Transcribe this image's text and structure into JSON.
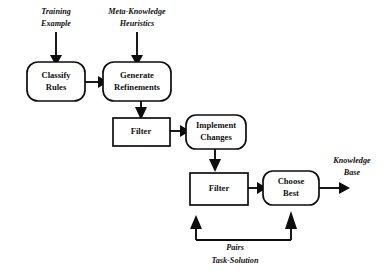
{
  "diagram": {
    "background_color": "#ffffff",
    "line_color": "#0d0d0d",
    "nodes": [
      {
        "id": "classify_rules",
        "label_line1": "Classify",
        "label_line2": "Rules",
        "shape": "rounded-rect",
        "x": 27,
        "y": 62,
        "w": 58,
        "h": 39
      },
      {
        "id": "generate_refinements",
        "label_line1": "Generate",
        "label_line2": "Refinements",
        "shape": "rounded-rect",
        "x": 103,
        "y": 62,
        "w": 68,
        "h": 39
      },
      {
        "id": "filter_1",
        "label_line1": "Filter",
        "label_line2": "",
        "shape": "rect",
        "x": 113,
        "y": 118,
        "w": 57,
        "h": 28
      },
      {
        "id": "implement_changes",
        "label_line1": "Implement",
        "label_line2": "Changes",
        "shape": "rounded-rect",
        "x": 186,
        "y": 115,
        "w": 60,
        "h": 34
      },
      {
        "id": "filter_2",
        "label_line1": "Filter",
        "label_line2": "",
        "shape": "rect",
        "x": 190,
        "y": 173,
        "w": 58,
        "h": 32
      },
      {
        "id": "choose_best",
        "label_line1": "Choose",
        "label_line2": "Best",
        "shape": "rounded-rect",
        "x": 263,
        "y": 171,
        "w": 56,
        "h": 34
      }
    ],
    "annotations": [
      {
        "id": "training_example",
        "line1": "Training",
        "line2": "Example",
        "x": 56,
        "y": 15
      },
      {
        "id": "meta_knowledge",
        "line1": "Meta-Knowledge",
        "line2": "Heuristics",
        "x": 137,
        "y": 15
      },
      {
        "id": "knowledge_base",
        "line1": "Knowledge",
        "line2": "Base",
        "x": 352,
        "y": 163
      },
      {
        "id": "pairs_task_solution",
        "line1": "Pairs",
        "line2": "Task-Solution",
        "x": 235,
        "y": 248
      }
    ],
    "edges": [
      {
        "id": "training-to-classify",
        "from": "training_example",
        "to": "classify_rules",
        "direction": "down"
      },
      {
        "id": "meta-to-generate",
        "from": "meta_knowledge",
        "to": "generate_refinements",
        "direction": "down"
      },
      {
        "id": "classify-to-generate",
        "from": "classify_rules",
        "to": "generate_refinements",
        "direction": "right"
      },
      {
        "id": "generate-to-filter1",
        "from": "generate_refinements",
        "to": "filter_1",
        "direction": "down"
      },
      {
        "id": "filter1-to-implement",
        "from": "filter_1",
        "to": "implement_changes",
        "direction": "right"
      },
      {
        "id": "implement-to-filter2",
        "from": "implement_changes",
        "to": "filter_2",
        "direction": "down"
      },
      {
        "id": "filter2-to-choose",
        "from": "filter_2",
        "to": "choose_best",
        "direction": "right"
      },
      {
        "id": "choose-to-knowledge-base",
        "from": "choose_best",
        "to": "knowledge_base",
        "direction": "right"
      },
      {
        "id": "feedback-to-filter2",
        "from": "pairs_task_solution",
        "to": "filter_2",
        "direction": "up"
      },
      {
        "id": "feedback-to-choose-best",
        "from": "pairs_task_solution",
        "to": "choose_best",
        "direction": "up"
      }
    ]
  }
}
